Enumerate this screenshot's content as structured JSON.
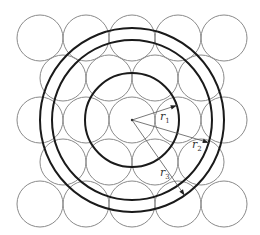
{
  "diagram": {
    "title": "",
    "center": {
      "x": 132,
      "y": 120
    },
    "small_circle_radius": 23,
    "rows": [
      {
        "y": 38,
        "xs": [
          40,
          86,
          132,
          178,
          224
        ]
      },
      {
        "y": 78,
        "xs": [
          63,
          109,
          155,
          201
        ]
      },
      {
        "y": 120,
        "xs": [
          40,
          86,
          132,
          178,
          224
        ]
      },
      {
        "y": 162,
        "xs": [
          63,
          109,
          155,
          201
        ]
      },
      {
        "y": 204,
        "xs": [
          40,
          86,
          132,
          178,
          224
        ]
      }
    ],
    "concentric_radii": [
      47,
      80,
      92
    ],
    "radius_labels": [
      {
        "label": "r",
        "sub": "1",
        "x": 160,
        "y": 120,
        "end": {
          "x": 178,
          "y": 105
        }
      },
      {
        "label": "r",
        "sub": "2",
        "x": 192,
        "y": 148,
        "end": {
          "x": 210,
          "y": 143
        }
      },
      {
        "label": "r",
        "sub": "3",
        "x": 160,
        "y": 176,
        "end": {
          "x": 185,
          "y": 196
        }
      }
    ],
    "colors": {
      "small_circle": "#8a8a8a",
      "big_circle": "#1a1a1a",
      "ray": "#555555"
    }
  }
}
